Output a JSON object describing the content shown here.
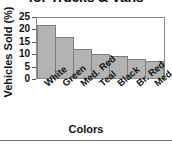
{
  "chart_data": {
    "type": "bar",
    "title": "for Trucks & Vans",
    "xlabel": "Colors",
    "ylabel": "Vehicles Sold (%)",
    "categories": [
      "White",
      "Green",
      "Med. Red",
      "Teal",
      "Black",
      "Br. Red",
      "Med. Blue"
    ],
    "values": [
      22,
      17,
      12,
      10,
      9,
      8,
      7
    ],
    "ylim": [
      0,
      25
    ],
    "yticks": [
      25,
      20,
      15,
      10,
      5,
      0
    ],
    "grid": false,
    "legend": null,
    "bar_color": "#b3b3b3",
    "bar_edge_color": "#7d7d7d",
    "axis_color": "#8a8a8a",
    "text_color": "#111111"
  }
}
